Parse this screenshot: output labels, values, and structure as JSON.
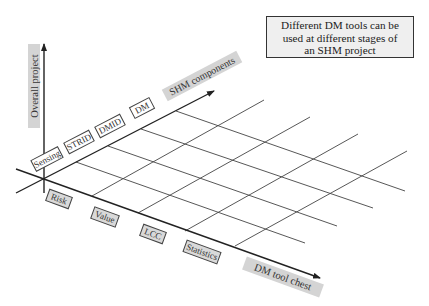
{
  "callout": {
    "lines": [
      "Different DM tools can be",
      "used at different stages of",
      "an SHM project"
    ]
  },
  "axes": {
    "vertical": {
      "label": "Overall project"
    },
    "shm": {
      "label": "SHM components"
    },
    "dm": {
      "label": "DM tool chest"
    }
  },
  "shm_components": [
    "Sensing",
    "STRID",
    "DMID",
    "DM"
  ],
  "dm_tools": [
    "Risk",
    "Value",
    "LCC",
    "Statistics"
  ],
  "colors": {
    "line": "#333333",
    "axis_label_fill": "#d4d4d4",
    "tool_label_fill": "#d9d9d9",
    "component_label_fill": "#ffffff",
    "callout_fill": "#efefef"
  }
}
